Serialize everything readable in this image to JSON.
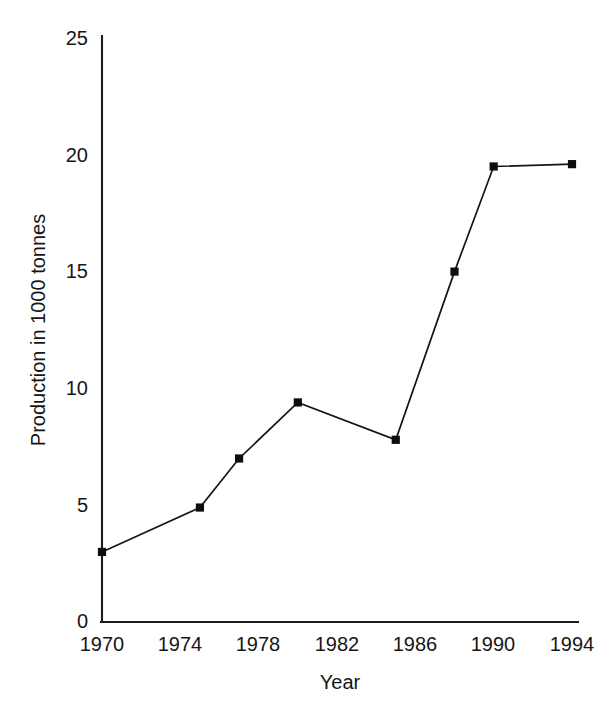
{
  "chart_data": {
    "type": "line",
    "title": "",
    "subtitle": "",
    "xlabel": "Year",
    "ylabel": "Production in 1000 tonnes",
    "x": [
      1970,
      1975,
      1977,
      1980,
      1985,
      1988,
      1990,
      1994
    ],
    "values": [
      3.0,
      4.9,
      7.0,
      9.4,
      7.8,
      15.0,
      19.5,
      19.6
    ],
    "series": [
      {
        "name": "Production",
        "values": [
          3.0,
          4.9,
          7.0,
          9.4,
          7.8,
          15.0,
          19.5,
          19.6
        ]
      }
    ],
    "xlim": [
      1970,
      1994
    ],
    "ylim": [
      0,
      25
    ],
    "xticks": [
      1970,
      1974,
      1978,
      1982,
      1986,
      1990,
      1994
    ],
    "xtick_labels": [
      "1970",
      "1974",
      "1978",
      "1982",
      "1986",
      "1990",
      "1994"
    ],
    "yticks": [
      0,
      5,
      10,
      15,
      20,
      25
    ],
    "ytick_labels": [
      "0",
      "5",
      "10",
      "15",
      "20",
      "25"
    ],
    "grid": false,
    "legend": false,
    "legend_position": "none",
    "marker": "square",
    "line_color": "#151515",
    "marker_color": "#0d0d0d",
    "background_color": "#ffffff",
    "annotations": []
  },
  "axes": {
    "x_title": "Year",
    "y_title": "Production in 1000 tonnes"
  },
  "ticks": {
    "y": [
      "25",
      "20",
      "15",
      "10",
      "5",
      "0"
    ],
    "x": [
      "1970",
      "1974",
      "1978",
      "1982",
      "1986",
      "1990",
      "1994"
    ]
  }
}
